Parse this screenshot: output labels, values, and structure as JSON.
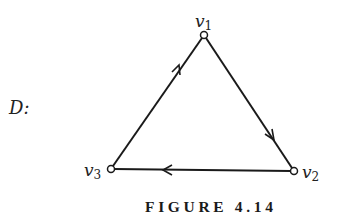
{
  "graph_label": "D:",
  "caption": "FIGURE 4.14",
  "nodes": [
    {
      "id": "v1",
      "name": "v",
      "sub": "1",
      "x": 204,
      "y": 35
    },
    {
      "id": "v2",
      "name": "v",
      "sub": "2",
      "x": 294,
      "y": 171
    },
    {
      "id": "v3",
      "name": "v",
      "sub": "3",
      "x": 111,
      "y": 169
    }
  ],
  "edges": [
    {
      "from": "v3",
      "to": "v1",
      "directed": true
    },
    {
      "from": "v1",
      "to": "v2",
      "directed": true
    },
    {
      "from": "v2",
      "to": "v3",
      "directed": true
    }
  ],
  "colors": {
    "stroke": "#1a1a1a",
    "node_fill": "#ffffff"
  }
}
